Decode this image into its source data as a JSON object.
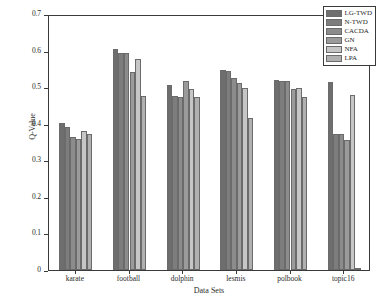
{
  "chart_data": {
    "type": "bar",
    "title": "",
    "xlabel": "Data Sets",
    "ylabel": "Q-Value",
    "categories": [
      "karate",
      "football",
      "dolphin",
      "lesmis",
      "polbook",
      "topic16"
    ],
    "ylim": [
      0,
      0.7
    ],
    "yticks": [
      "0",
      "0.1",
      "0.2",
      "0.3",
      "0.4",
      "0.5",
      "0.6",
      "0.7"
    ],
    "ytick_values": [
      0,
      0.1,
      0.2,
      0.3,
      0.4,
      0.5,
      0.6,
      0.7
    ],
    "grid": false,
    "legend_position": "top-right",
    "series": [
      {
        "name": "LG-TWD",
        "color": "#6e6e6e",
        "values": [
          0.402,
          0.603,
          0.506,
          0.547,
          0.519,
          0.513
        ]
      },
      {
        "name": "N-TWD",
        "color": "#7d7d7d",
        "values": [
          0.391,
          0.594,
          0.477,
          0.543,
          0.518,
          0.372
        ]
      },
      {
        "name": "CACDA",
        "color": "#8c8c8c",
        "values": [
          0.363,
          0.594,
          0.474,
          0.524,
          0.517,
          0.371
        ]
      },
      {
        "name": "GN",
        "color": "#9b9b9b",
        "values": [
          0.358,
          0.541,
          0.518,
          0.511,
          0.494,
          0.355
        ]
      },
      {
        "name": "NFA",
        "color": "#c6c6c6",
        "values": [
          0.38,
          0.578,
          0.494,
          0.497,
          0.498,
          0.478
        ]
      },
      {
        "name": "LPA",
        "color": "#b0b0b0",
        "values": [
          0.372,
          0.476,
          0.474,
          0.416,
          0.472,
          0.005
        ]
      }
    ]
  }
}
